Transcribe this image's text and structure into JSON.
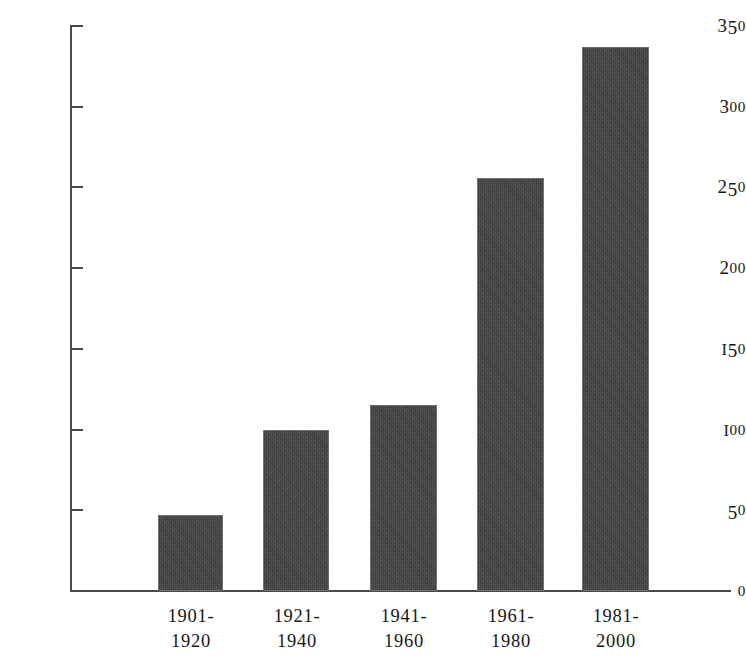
{
  "chart_data": {
    "type": "bar",
    "title": "",
    "subtitle": "",
    "xlabel": "",
    "ylabel": "",
    "categories": [
      "1901-\n1920",
      "1921-\n1940",
      "1941-\n1960",
      "1961-\n1980",
      "1981-\n2000"
    ],
    "category_lines": [
      [
        "1901-",
        "1920"
      ],
      [
        "1921-",
        "1940"
      ],
      [
        "1941-",
        "1960"
      ],
      [
        "1961-",
        "1980"
      ],
      [
        "1981-",
        "2000"
      ]
    ],
    "values": [
      47,
      100,
      115,
      256,
      337
    ],
    "ylim": [
      0,
      350
    ],
    "ytick_values": [
      0,
      50,
      100,
      150,
      200,
      250,
      300,
      350
    ],
    "ytick_labels": [
      "0",
      "50",
      "100",
      "150",
      "200",
      "250",
      "300",
      "350"
    ],
    "grid": false,
    "legend": null,
    "legend_position": "none",
    "bar_color": "#3b3b3b",
    "axis_color": "#4a4a4a",
    "background_color": "#ffffff",
    "text_color": "#17171c",
    "annotations": []
  }
}
